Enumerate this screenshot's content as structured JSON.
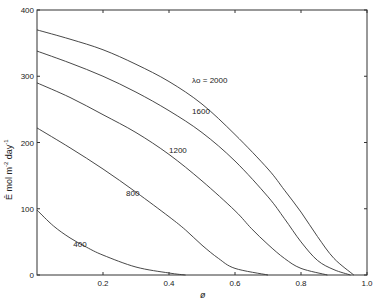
{
  "chart_data": {
    "type": "line",
    "title": "",
    "xlabel": "ø",
    "ylabel": "Ē mol m-2 day-1",
    "xlim": [
      0,
      1.0
    ],
    "ylim": [
      0,
      400
    ],
    "x_ticks": [
      "0.2",
      "0.4",
      "0.6",
      "0.8",
      "1.0"
    ],
    "y_ticks": [
      "0",
      "100",
      "200",
      "300",
      "400"
    ],
    "grid": false,
    "legend": "inline curve labels",
    "series": [
      {
        "name": "λo = 2000",
        "label": "λo = 2000",
        "label_pos": [
          0.47,
          290
        ],
        "x": [
          0,
          0.1,
          0.2,
          0.3,
          0.4,
          0.5,
          0.6,
          0.7,
          0.75,
          0.8,
          0.85,
          0.9,
          0.96
        ],
        "y": [
          370,
          356,
          340,
          318,
          292,
          258,
          212,
          160,
          128,
          95,
          58,
          25,
          0
        ]
      },
      {
        "name": "1600",
        "label": "1600",
        "label_pos": [
          0.47,
          243
        ],
        "x": [
          0,
          0.1,
          0.2,
          0.3,
          0.4,
          0.5,
          0.6,
          0.7,
          0.75,
          0.8,
          0.85,
          0.9,
          0.95
        ],
        "y": [
          338,
          320,
          300,
          276,
          248,
          215,
          172,
          118,
          85,
          50,
          22,
          8,
          0
        ]
      },
      {
        "name": "1200",
        "label": "1200",
        "label_pos": [
          0.4,
          184
        ],
        "x": [
          0,
          0.1,
          0.2,
          0.3,
          0.4,
          0.5,
          0.6,
          0.65,
          0.7,
          0.75,
          0.8,
          0.88
        ],
        "y": [
          290,
          268,
          242,
          215,
          182,
          142,
          97,
          70,
          46,
          25,
          10,
          0
        ]
      },
      {
        "name": "800",
        "label": "800",
        "label_pos": [
          0.27,
          120
        ],
        "x": [
          0,
          0.1,
          0.2,
          0.3,
          0.4,
          0.45,
          0.5,
          0.55,
          0.6,
          0.7
        ],
        "y": [
          222,
          192,
          160,
          125,
          88,
          68,
          45,
          25,
          10,
          0
        ]
      },
      {
        "name": "400",
        "label": "400",
        "label_pos": [
          0.11,
          42
        ],
        "x": [
          0,
          0.05,
          0.1,
          0.15,
          0.2,
          0.3,
          0.4,
          0.45
        ],
        "y": [
          98,
          74,
          56,
          42,
          30,
          12,
          3,
          0
        ]
      }
    ]
  },
  "axes": {
    "x_title": "ø",
    "y_title_main": "Ē  mol  m",
    "y_title_sup1": "-2",
    "y_title_mid": " day",
    "y_title_sup2": "-1",
    "x_zero_label": "0"
  }
}
